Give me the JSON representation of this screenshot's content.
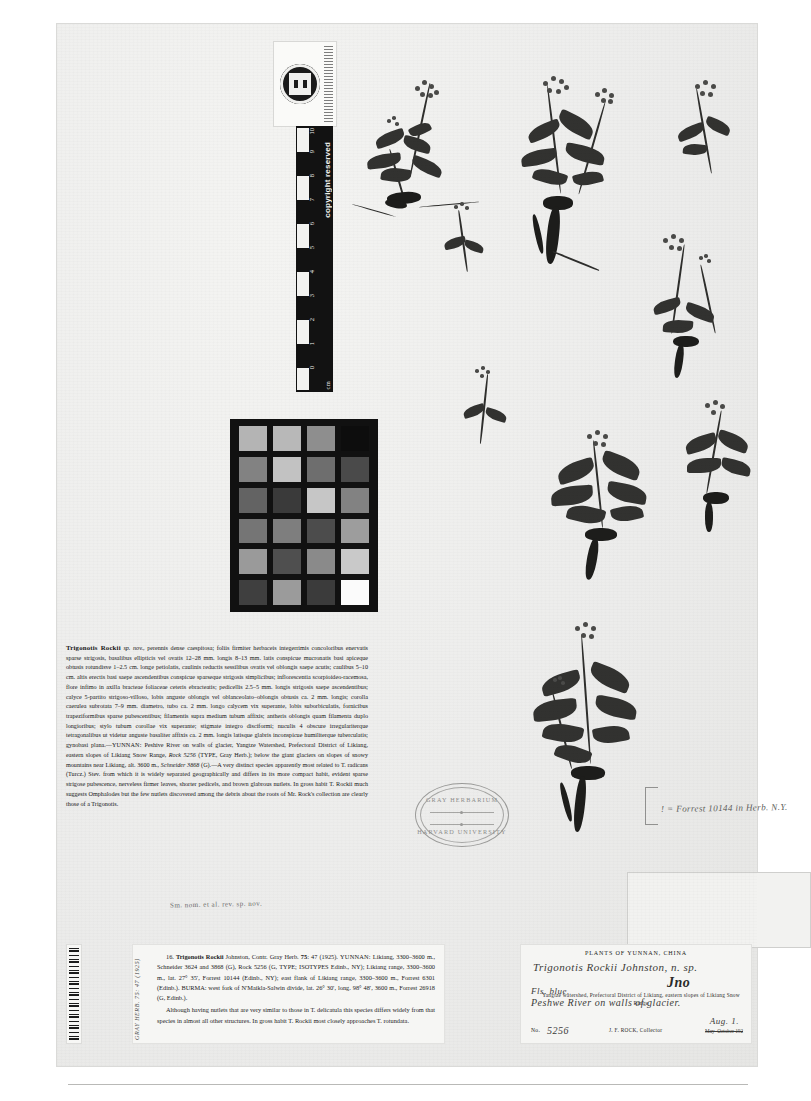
{
  "sheet": {
    "institution_stamp": {
      "line1": "GRAY HERBARIUM",
      "line2": "HARVARD UNIVERSITY"
    },
    "ruler": {
      "unit_label": "cm",
      "copyright_text": "copyright reserved",
      "ticks": [
        "0",
        "1",
        "2",
        "3",
        "4",
        "5",
        "6",
        "7",
        "8",
        "9",
        "10"
      ]
    },
    "color_chart": {
      "name": "grayscale-step-chart",
      "rows": 6,
      "cols": 4,
      "patches": [
        "#b4b4b4",
        "#b8b8b8",
        "#8e8e8e",
        "#0d0d0d",
        "#828282",
        "#c2c2c2",
        "#6e6e6e",
        "#4a4a4a",
        "#636363",
        "#3a3a3a",
        "#c6c6c6",
        "#828282",
        "#757575",
        "#7e7e7e",
        "#4c4c4c",
        "#9d9d9d",
        "#9a9a9a",
        "#4f4f4f",
        "#8a8a8a",
        "#c9c9c9",
        "#3f3f3f",
        "#9b9b9b",
        "#3b3b3b",
        "#fbfbfb"
      ]
    },
    "determination_note": "! = Forrest 10144 in Herb. N.Y."
  },
  "protologue": {
    "name": "Trigonotis Rockii",
    "rank_abbrev": "sp. nov.,",
    "body": "perennis dense caespitosa; foliis firmiter herbaceis integerrimis concoloribus enervatis sparse strigosis, basalibus ellipticis vel ovatis 12–28 mm. longis 8–13 mm. latis conspicue mucronatis basi apiceque obtusis rotundisve 1–2.5 cm. longe petiolatis, caulinis reductis sessilibus ovatis vel oblongis saepe acutis; caulibus 5–10 cm. altis erectis basi saepe ascendentibus conspicue sparseque strigosis simplicibus; inflorescentia scorpioideo-racemosa, flore infimo in axilla bracteae foliaceae ceteris ebracteatis; pedicellis 2.5–5 mm. longis strigosis saepe ascendentibus; calyce 5-partito strigoso-villoso, lobis anguste oblongis vel oblanceolato–oblongis obtusis ca. 2 mm. longis; corolla caerulea subrotata 7–9 mm. diametro, tubo ca. 2 mm. longo calycem vix superante, lobis suborbiculatis, fornicibus trapeziformibus sparse pubescentibus; filamentis supra medium tubum affixis; antheris oblongis quam filamenta duplo longioribus; stylo tubum corollae vix superante; stigmate integro disciformi; nuculis 4 obscure irregulariterque tetragonalibus ut videtur anguste basaliter affixis ca. 2 mm. longis latisque glabris inconspicue humiliterque tuberculatis; gynobasi plana.—",
    "region": "YUNNAN:",
    "locality": " Peshive River on walls of glacier, Yangtze Watershed, Prefectoral District of Likiang, eastern slopes of Likiang Snow Range, ",
    "collection1": "Rock 5256",
    "collection1_note": " (TYPE, Gray Herb.); below the giant glaciers on slopes of snowy mountains near Likiang, alt. 3600 m., ",
    "collection2": "Schneider 3868",
    "discussion": " (G).—A very distinct species apparently most related to T. radicans (Turcz.) Stev. from which it is widely separated geographically and differs in its more compact habit, evident sparse strigose pubescence, nerveless firmer leaves, shorter pedicels, and brown glabrous nutlets.  In gross habit T. Rockii much suggests Omphalodes but the few nutlets discovered among the debris about the roots of Mr. Rock's collection are clearly those of a Trigonotis.",
    "pencil_annotation": "Sm. nom. et al. rev. sp. nov."
  },
  "citation_label": {
    "entry_number": "16.",
    "taxon": "Trigonotis Rockii",
    "author": " Johnston, Contr. Gray Herb. ",
    "volume": "75",
    "pages": ": 47 (1925).",
    "region": "YUNNAN:",
    "para1": " Likiang, 3300–3600 m., Schneider 3624 and 3868 (G), Rock 5256 (G, TYPE; ISOTYPES Edinb., NY); Likiang range, 3300–3600 m., lat. 27° 35′, Forrest 10144 (Edinb., NY); east flank of Likiang range, 3300–3600 m., Forrest 6301 (Edinb.). BURMA: west fork of N'Maikla-Salwin divide, lat. 26° 30′, long. 98° 48′, 3600 m., Forrest 26918 (G, Edinb.).",
    "para2": "Although having nutlets that are very similar to those in T. delicatula this species differs widely from that species in almost all other structures.  In gross habit T. Rockii most closely approaches T. rotundata.",
    "side_stamp": "GRAY HERB. 75: 47 (1925)"
  },
  "collection_label": {
    "header": "PLANTS OF YUNNAN, CHINA",
    "handwritten_name": "Trigonotis Rockii Johnston, n. sp.",
    "handwritten_initials": "Jno",
    "handwritten_color": "Fls. blue.",
    "handwritten_locality": "Peshwe River on walls of glacier.",
    "printed_locality": "Yangtze watershed, Prefectoral District of Likiang, eastern slopes of Likiang Snow Range",
    "number_prefix": "No.",
    "number_value": "5256",
    "collector": "J. F. ROCK, Collector",
    "date_struck": "May–October 192",
    "handwritten_date": "Aug. 1."
  }
}
